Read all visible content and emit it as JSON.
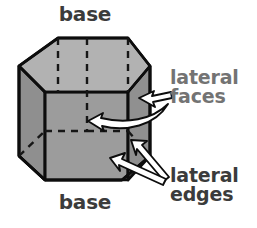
{
  "diagram": {
    "labels": {
      "base_top": "base",
      "base_bottom": "base",
      "lateral_faces_line1": "lateral",
      "lateral_faces_line2": "faces",
      "lateral_edges_line1": "lateral",
      "lateral_edges_line2": "edges"
    },
    "colors": {
      "background": "#ffffff",
      "top_face": "#b2b2b2",
      "front_face": "#9c9c9c",
      "left_face": "#8f8f8f",
      "right_face": "#909090",
      "outline": "#0d0d0d",
      "hidden_edge": "#161616",
      "label_dark": "#3b3b3b",
      "label_gray": "#737373",
      "arrow_fill": "#ffffff",
      "arrow_stroke": "#0d0d0d"
    },
    "shape": {
      "kind": "hexagonal prism",
      "visible_faces": 3,
      "hidden_edges_style": "dashed",
      "top_hexagon_points": "58,38 128,38 150,66 128,92 58,92 19,66",
      "bottom_hexagon_front_points": "45,180 122,180 145,156 122,131 45,131 19,156",
      "vertical_edge_x": [
        19,
        45,
        58,
        122,
        128,
        150
      ]
    },
    "annotations": [
      {
        "name": "arrow-to-right-lateral-face",
        "points_to": "right lateral face",
        "from_label": "lateral faces"
      },
      {
        "name": "arrow-to-front-lateral-face",
        "points_to": "front lateral face",
        "from_label": "lateral faces"
      },
      {
        "name": "arrow-to-upper-lateral-edge",
        "points_to": "right vertical edge",
        "from_label": "lateral edges"
      },
      {
        "name": "arrow-to-lower-lateral-edge",
        "points_to": "front-right vertical edge",
        "from_label": "lateral edges"
      }
    ]
  }
}
